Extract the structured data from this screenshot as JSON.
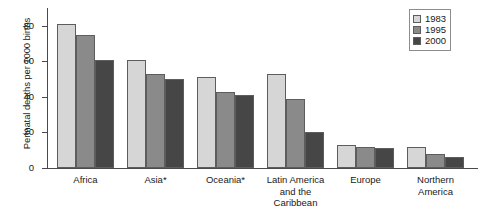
{
  "chart_data": {
    "type": "bar",
    "title": "",
    "xlabel": "",
    "ylabel": "Perinatal deaths per 1000 births",
    "ylim": [
      0,
      90
    ],
    "yticks": [
      0,
      20,
      40,
      60,
      80
    ],
    "grid": false,
    "legend_position": "top-right",
    "categories": [
      "Africa",
      "Asia*",
      "Oceania*",
      "Latin America\nand the\nCaribbean",
      "Europe",
      "Northern\nAmerica"
    ],
    "series": [
      {
        "name": "1983",
        "color": "#d6d6d6",
        "values": [
          81,
          61,
          51,
          53,
          13,
          12
        ]
      },
      {
        "name": "1995",
        "color": "#8a8a8a",
        "values": [
          75,
          53,
          43,
          39,
          12,
          8
        ]
      },
      {
        "name": "2000",
        "color": "#464646",
        "values": [
          61,
          50,
          41,
          20,
          11,
          6
        ]
      }
    ]
  }
}
